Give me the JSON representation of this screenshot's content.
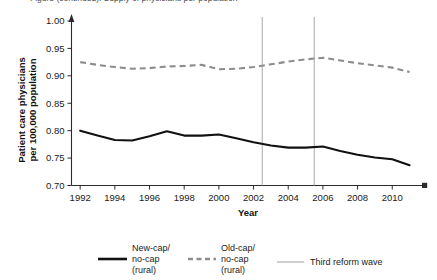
{
  "figure": {
    "cut_off_caption": "Figure (continued). Supply of physicians per population",
    "background_color": "#ffffff"
  },
  "chart_data": {
    "type": "line",
    "title": "",
    "xlabel": "Year",
    "ylabel": "Patient care physicians per 100,000 population",
    "xlim": [
      1991.5,
      2011.6
    ],
    "ylim": [
      0.7,
      1.0
    ],
    "xticks": [
      1992,
      1994,
      1996,
      1998,
      2000,
      2002,
      2004,
      2006,
      2008,
      2010
    ],
    "xtick_labels": [
      "1992",
      "1994",
      "1996",
      "1998",
      "2000",
      "2002",
      "2004",
      "2006",
      "2008",
      "2010"
    ],
    "yticks": [
      0.7,
      0.75,
      0.8,
      0.85,
      0.9,
      0.95,
      1.0
    ],
    "ytick_labels": [
      "0.70",
      "0.75",
      "0.80",
      "0.85",
      "0.90",
      "0.95",
      "1.00"
    ],
    "grid": false,
    "legend_position": "below",
    "x": [
      1992,
      1993,
      1994,
      1995,
      1996,
      1997,
      1998,
      1999,
      2000,
      2001,
      2002,
      2003,
      2004,
      2005,
      2006,
      2007,
      2008,
      2009,
      2010,
      2011
    ],
    "series": [
      {
        "name": "New-cap/no-cap (rural)",
        "style": "solid",
        "color": "#111111",
        "values": [
          0.8,
          0.791,
          0.783,
          0.782,
          0.79,
          0.799,
          0.791,
          0.791,
          0.793,
          0.786,
          0.779,
          0.773,
          0.769,
          0.769,
          0.771,
          0.763,
          0.756,
          0.751,
          0.748,
          0.737
        ]
      },
      {
        "name": "Old-cap/no-cap (rural)",
        "style": "dashed",
        "color": "#8d8d8d",
        "values": [
          0.925,
          0.92,
          0.916,
          0.913,
          0.914,
          0.917,
          0.918,
          0.92,
          0.912,
          0.913,
          0.916,
          0.921,
          0.926,
          0.93,
          0.933,
          0.928,
          0.923,
          0.919,
          0.915,
          0.907
        ]
      }
    ],
    "reference_lines": [
      {
        "name": "Third reform wave",
        "x": 2002.5,
        "color": "#a8a8a8"
      },
      {
        "name": "Third reform wave",
        "x": 2005.5,
        "color": "#a8a8a8"
      }
    ]
  },
  "legend": {
    "items": [
      {
        "label_line1": "New-cap/",
        "label_line2": "no-cap",
        "label_line3": "(rural)",
        "swatch": "solid-line-swatch"
      },
      {
        "label_line1": "Old-cap/",
        "label_line2": "no-cap",
        "label_line3": "(rural)",
        "swatch": "dashed-line-swatch"
      },
      {
        "label_line1": "Third reform wave",
        "label_line2": "",
        "label_line3": "",
        "swatch": "thin-vertical-line-swatch"
      }
    ]
  }
}
